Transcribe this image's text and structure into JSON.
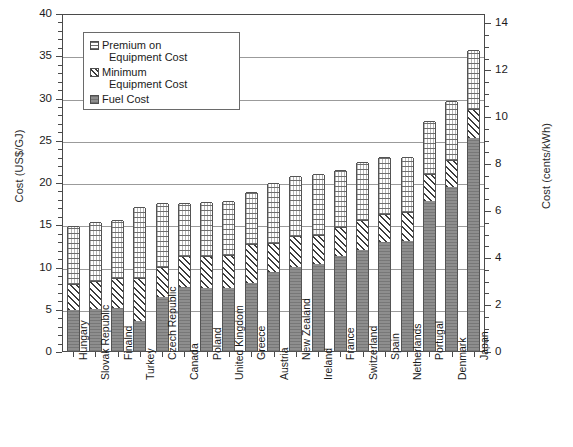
{
  "chart_data": {
    "type": "bar",
    "stacked": true,
    "title": "",
    "xlabel": "",
    "ylabel": "Cost (US$/GJ)",
    "ylabel_right": "Cost (cents/kWh)",
    "ylim": [
      0,
      40
    ],
    "yticks": [
      0,
      5,
      10,
      15,
      20,
      25,
      30,
      35,
      40
    ],
    "ytick_labels": [
      "0",
      "5",
      "10",
      "15",
      "20",
      "25",
      "30",
      "35",
      "40"
    ],
    "ylim_right": [
      0,
      14.4
    ],
    "yticks_right": [
      0,
      2,
      4,
      6,
      8,
      10,
      12,
      14
    ],
    "ytick_labels_right": [
      "0",
      "2",
      "4",
      "6",
      "8",
      "10",
      "12",
      "14"
    ],
    "grid": true,
    "legend_position": "upper left inside",
    "categories": [
      "Hungary",
      "Slovak Republic",
      "Finalnd",
      "Turkey",
      "Czech Republic",
      "Canada",
      "Poland",
      "United Kingdom",
      "Greece",
      "Austria",
      "New Zealand",
      "Ireland",
      "France",
      "Switzerland",
      "Spain",
      "Netherlands",
      "Portugal",
      "Denmark",
      "Japan"
    ],
    "series": [
      {
        "name": "Fuel Cost",
        "pattern": "solid-gray",
        "values": [
          4.8,
          5.0,
          5.1,
          3.6,
          6.4,
          7.6,
          7.5,
          7.4,
          8.1,
          9.3,
          10.0,
          10.3,
          11.3,
          12.0,
          12.9,
          13.0,
          17.8,
          19.4,
          25.2
        ]
      },
      {
        "name": "Minimum Equipment Cost",
        "pattern": "diagonal-hatch",
        "values": [
          3.1,
          3.3,
          3.5,
          5.0,
          3.5,
          3.6,
          3.7,
          4.0,
          4.6,
          3.5,
          3.6,
          3.4,
          3.4,
          3.5,
          3.3,
          3.4,
          3.1,
          3.2,
          3.5
        ]
      },
      {
        "name": "Premium on Equipment Cost",
        "pattern": "dotted-light",
        "values": [
          6.9,
          7.0,
          6.9,
          8.4,
          7.6,
          6.3,
          6.4,
          6.4,
          6.1,
          7.1,
          7.1,
          7.2,
          6.7,
          6.9,
          6.8,
          6.6,
          6.3,
          7.0,
          6.9
        ]
      }
    ],
    "totals": [
      14.8,
      15.3,
      15.5,
      17.0,
      17.5,
      17.5,
      17.6,
      17.8,
      18.8,
      19.9,
      20.7,
      20.9,
      21.4,
      22.4,
      23.0,
      23.0,
      27.2,
      29.6,
      35.6
    ]
  },
  "legend": {
    "items": [
      {
        "label_line1": "Premium on",
        "label_line2": "Equipment Cost"
      },
      {
        "label_line1": "Minimum",
        "label_line2": "Equipment Cost"
      },
      {
        "label_line1": "Fuel Cost",
        "label_line2": ""
      }
    ]
  }
}
